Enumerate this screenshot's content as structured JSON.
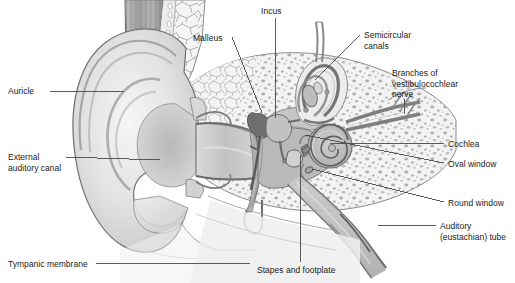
{
  "figure": {
    "type": "anatomical-diagram",
    "width": 515,
    "height": 283,
    "background_color": "#ffffff"
  },
  "palette": {
    "line": "#3a3a3a",
    "leader_line": "#4a4a4a",
    "text": "#1b1b1b",
    "bone_fill": "#f2f2f2",
    "bone_outline": "#8e8e8e",
    "cartilage_light": "#e3e3e3",
    "cartilage_mid": "#cfcfcf",
    "cartilage_dark": "#b3b3b3",
    "cavity_fill": "#b9b9b9",
    "canal_fill": "#c8c8c8",
    "membrane": "#8a8a8a",
    "marrow_speckle": "#9a9a9a",
    "skin_shadow": "#a8a8a8",
    "muscle_stripe": "#9d9d9d",
    "cochlea_fill": "#c4c4c4"
  },
  "labels": [
    {
      "id": "auricle",
      "text": "Auricle",
      "x": 8,
      "y": 86,
      "align": "left",
      "leader": {
        "x1": 50,
        "y1": 91,
        "x2": 124,
        "y2": 91
      }
    },
    {
      "id": "external-auditory-canal",
      "text": "External\nauditory canal",
      "x": 8,
      "y": 152,
      "align": "left",
      "leader": {
        "x1": 66,
        "y1": 157,
        "x2": 160,
        "y2": 160
      }
    },
    {
      "id": "tympanic-membrane",
      "text": "Tympanic membrane",
      "x": 8,
      "y": 259,
      "align": "left",
      "leader": {
        "x1": 96,
        "y1": 263,
        "x2": 250,
        "y2": 263
      }
    },
    {
      "id": "malleus",
      "text": "Malleus",
      "x": 193,
      "y": 33,
      "align": "left",
      "leader": {
        "x1": 232,
        "y1": 37,
        "x2": 262,
        "y2": 113
      }
    },
    {
      "id": "incus",
      "text": "Incus",
      "x": 261,
      "y": 6,
      "align": "left",
      "leader": {
        "x1": 275,
        "y1": 18,
        "x2": 275,
        "y2": 118
      }
    },
    {
      "id": "semicircular-canals",
      "text": "Semicircular\ncanals",
      "x": 364,
      "y": 30,
      "align": "left",
      "leader": {
        "x1": 360,
        "y1": 35,
        "x2": 315,
        "y2": 80
      }
    },
    {
      "id": "branches-of-vestibulocochlear-nerve",
      "text": "Branches of\nvestibulocochlear\nnerve",
      "x": 392,
      "y": 68,
      "align": "left",
      "leader": {
        "x1": 404,
        "y1": 99,
        "x2": 404,
        "y2": 114
      }
    },
    {
      "id": "cochlea",
      "text": "Cochlea",
      "x": 448,
      "y": 139,
      "align": "left",
      "leader": {
        "x1": 444,
        "y1": 143,
        "x2": 330,
        "y2": 143
      }
    },
    {
      "id": "oval-window",
      "text": "Oval window",
      "x": 448,
      "y": 159,
      "align": "left",
      "leader": {
        "x1": 444,
        "y1": 163,
        "x2": 305,
        "y2": 135
      }
    },
    {
      "id": "round-window",
      "text": "Round window",
      "x": 448,
      "y": 198,
      "align": "left",
      "leader": {
        "x1": 444,
        "y1": 202,
        "x2": 312,
        "y2": 169
      }
    },
    {
      "id": "auditory-eustachian-tube",
      "text": "Auditory\n(eustachian) tube",
      "x": 440,
      "y": 221,
      "align": "left",
      "leader": {
        "x1": 436,
        "y1": 225,
        "x2": 378,
        "y2": 225
      }
    },
    {
      "id": "stapes-and-footplate",
      "text": "Stapes and footplate",
      "x": 257,
      "y": 265,
      "align": "left",
      "leader": {
        "x1": 300,
        "y1": 262,
        "x2": 300,
        "y2": 155
      }
    }
  ],
  "structures": [
    {
      "id": "auricle",
      "name": "Auricle (pinna)"
    },
    {
      "id": "external-auditory-canal",
      "name": "External auditory canal"
    },
    {
      "id": "tympanic-membrane",
      "name": "Tympanic membrane (eardrum)"
    },
    {
      "id": "malleus",
      "name": "Malleus"
    },
    {
      "id": "incus",
      "name": "Incus"
    },
    {
      "id": "stapes",
      "name": "Stapes and footplate"
    },
    {
      "id": "semicircular-canals",
      "name": "Semicircular canals"
    },
    {
      "id": "cochlea",
      "name": "Cochlea"
    },
    {
      "id": "oval-window",
      "name": "Oval window"
    },
    {
      "id": "round-window",
      "name": "Round window"
    },
    {
      "id": "eustachian-tube",
      "name": "Auditory (eustachian) tube"
    },
    {
      "id": "vestibulocochlear-nerve",
      "name": "Branches of vestibulocochlear nerve"
    },
    {
      "id": "temporal-bone",
      "name": "Temporal bone (cancellous)"
    },
    {
      "id": "middle-ear-cavity",
      "name": "Middle ear cavity"
    }
  ]
}
